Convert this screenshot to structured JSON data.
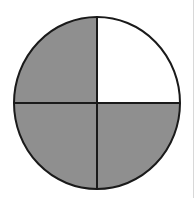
{
  "diagram": {
    "type": "fraction-circle",
    "total_parts": 4,
    "shaded_parts": 3,
    "unshaded_part": "top-right",
    "fraction": "3/4",
    "colors": {
      "shaded": "#8f8f8f",
      "unshaded": "#ffffff",
      "outline": "#1a1a1a"
    }
  }
}
